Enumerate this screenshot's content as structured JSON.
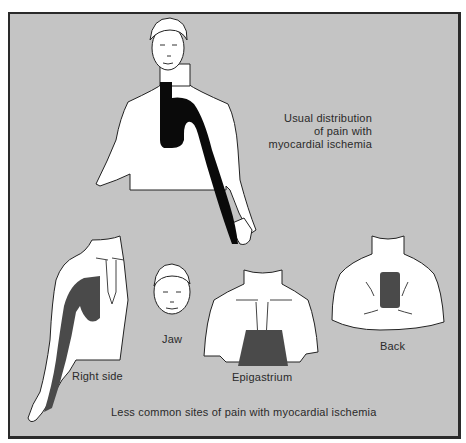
{
  "figure": {
    "main_caption": [
      "Usual distribution",
      "of pain with",
      "myocardial ischemia"
    ],
    "panels": [
      {
        "id": "right-side",
        "label": "Right side"
      },
      {
        "id": "jaw",
        "label": "Jaw"
      },
      {
        "id": "epigastrium",
        "label": "Epigastrium"
      },
      {
        "id": "back",
        "label": "Back"
      }
    ],
    "bottom_caption": "Less common sites of pain with  myocardial ischemia"
  },
  "colors": {
    "background": "#c4c4c4",
    "body": "#ffffff",
    "usual_pain": "#0a0a0a",
    "less_common_pain": "#4a4a4a",
    "frame": "#2a2a2a"
  }
}
